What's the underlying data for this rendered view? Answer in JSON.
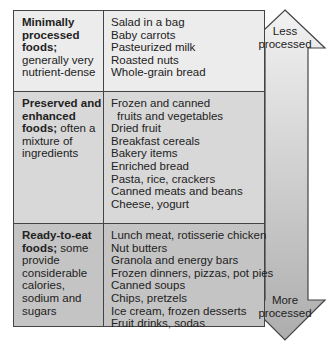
{
  "colors": {
    "row1_bg": "#ececec",
    "row2_bg": "#d8d8d8",
    "row3_bg": "#c2c2c2",
    "border": "#444444",
    "arrow_top": "#f0f0f0",
    "arrow_bottom": "#b0b0b0"
  },
  "rows": [
    {
      "category_bold": "Minimally processed foods;",
      "category_desc": "generally very nutrient-dense",
      "items": [
        "Salad in a bag",
        "Baby carrots",
        "Pasteurized milk",
        "Roasted nuts",
        "Whole-grain bread"
      ]
    },
    {
      "category_bold": "Preserved and enhanced foods;",
      "category_desc": "often a mixture of ingredients",
      "items": [
        "Frozen and canned",
        "fruits and vegetables",
        "Dried fruit",
        "Breakfast cereals",
        "Bakery items",
        "Enriched bread",
        "Pasta, rice, crackers",
        "Canned meats and beans",
        "Cheese, yogurt"
      ]
    },
    {
      "category_bold": "Ready-to-eat foods;",
      "category_desc": "some provide considerable calories, sodium and sugars",
      "items": [
        "Lunch meat, rotisserie chicken",
        "Nut butters",
        "Granola and energy bars",
        "Frozen dinners, pizzas, pot pies",
        "Canned soups",
        "Chips, pretzels",
        "Ice cream, frozen desserts",
        "Fruit drinks, sodas"
      ]
    }
  ],
  "arrow": {
    "top_label_line1": "Less",
    "top_label_line2": "processed",
    "bottom_label_line1": "More",
    "bottom_label_line2": "processed"
  }
}
